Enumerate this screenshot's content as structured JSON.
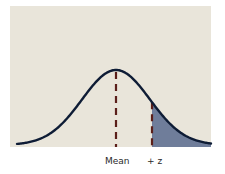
{
  "diagram": {
    "type": "normal-distribution",
    "panel_color": "#e9e5da",
    "curve_color": "#0e1c35",
    "dash_color": "#5b1f1a",
    "shade_color": "#6f7d9a",
    "labels": {
      "mean": "Mean",
      "z": "+ z"
    },
    "markers": [
      {
        "name": "mean",
        "position": "center"
      },
      {
        "name": "z",
        "position": "+z right of mean"
      }
    ],
    "shaded_region": "area under curve to the right of +z"
  }
}
